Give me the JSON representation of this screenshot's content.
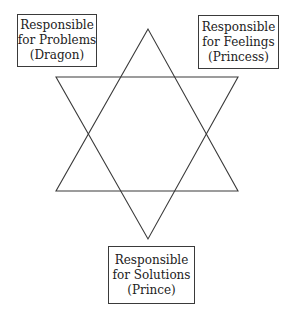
{
  "diagram": {
    "type": "hexagram-role-diagram",
    "shape": "six-pointed star (two overlapping triangles)",
    "line_color": "#3a3a3a",
    "boxes": {
      "top_left": {
        "line1": "Responsible",
        "line2": "for Problems",
        "line3": "(Dragon)"
      },
      "top_right": {
        "line1": "Responsible",
        "line2": "for Feelings",
        "line3": "(Princess)"
      },
      "bottom": {
        "line1": "Responsible",
        "line2": "for Solutions",
        "line3": "(Prince)"
      }
    }
  }
}
